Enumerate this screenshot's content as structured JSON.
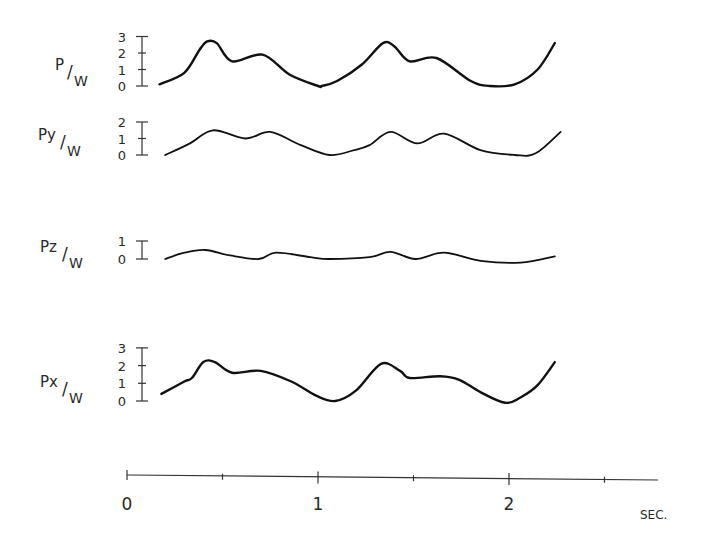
{
  "chart_data": {
    "type": "line",
    "title": "",
    "xlabel": "SEC.",
    "x_ticks": [
      "0",
      "1",
      "2"
    ],
    "x_minor_ticks": [
      0.5,
      1.5,
      2.5
    ],
    "xlim": [
      0,
      2.8
    ],
    "grid": false,
    "legend": null,
    "panels": [
      {
        "name": "P/W",
        "ylabel_num": "P",
        "ylabel_den": "W",
        "y_ticks": [
          "0",
          "1",
          "2",
          "3"
        ],
        "ylim": [
          0,
          3
        ],
        "stroke_width": 2.4,
        "x": [
          0.17,
          0.3,
          0.38,
          0.42,
          0.47,
          0.55,
          0.71,
          0.85,
          1.0,
          1.02,
          1.1,
          1.23,
          1.34,
          1.4,
          1.48,
          1.62,
          1.8,
          1.9,
          2.03,
          2.15,
          2.24
        ],
        "values": [
          0.1,
          0.8,
          2.2,
          2.7,
          2.6,
          1.5,
          1.9,
          0.7,
          0.0,
          0.0,
          0.3,
          1.3,
          2.6,
          2.4,
          1.5,
          1.7,
          0.3,
          0.0,
          0.1,
          1.0,
          2.6
        ]
      },
      {
        "name": "Py/W",
        "ylabel_num": "Py",
        "ylabel_den": "W",
        "y_ticks": [
          "0",
          "1",
          "2"
        ],
        "ylim": [
          0,
          2
        ],
        "stroke_width": 1.8,
        "x": [
          0.2,
          0.33,
          0.45,
          0.62,
          0.75,
          0.91,
          1.06,
          1.19,
          1.27,
          1.38,
          1.52,
          1.66,
          1.85,
          2.03,
          2.14,
          2.27
        ],
        "values": [
          0.0,
          0.7,
          1.5,
          1.0,
          1.4,
          0.6,
          0.0,
          0.3,
          0.6,
          1.4,
          0.7,
          1.3,
          0.3,
          0.0,
          0.1,
          1.4
        ]
      },
      {
        "name": "Pz/W",
        "ylabel_num": "Pz",
        "ylabel_den": "W",
        "y_ticks": [
          "0",
          "1"
        ],
        "ylim": [
          0,
          1
        ],
        "stroke_width": 1.8,
        "x": [
          0.2,
          0.3,
          0.41,
          0.54,
          0.69,
          0.78,
          0.96,
          1.06,
          1.27,
          1.38,
          1.51,
          1.66,
          1.85,
          2.06,
          2.24
        ],
        "values": [
          0.0,
          0.35,
          0.5,
          0.2,
          0.0,
          0.35,
          0.1,
          0.0,
          0.1,
          0.4,
          0.0,
          0.35,
          -0.1,
          -0.2,
          0.15
        ]
      },
      {
        "name": "Px/W",
        "ylabel_num": "Px",
        "ylabel_den": "W",
        "y_ticks": [
          "0",
          "1",
          "2",
          "3"
        ],
        "ylim": [
          0,
          3
        ],
        "stroke_width": 2.4,
        "x": [
          0.18,
          0.3,
          0.34,
          0.4,
          0.46,
          0.55,
          0.7,
          0.86,
          0.99,
          1.09,
          1.2,
          1.33,
          1.43,
          1.48,
          1.64,
          1.74,
          1.85,
          1.98,
          2.06,
          2.15,
          2.24
        ],
        "values": [
          0.4,
          1.1,
          1.3,
          2.2,
          2.2,
          1.6,
          1.7,
          1.1,
          0.3,
          0.0,
          0.6,
          2.1,
          1.7,
          1.3,
          1.4,
          1.2,
          0.5,
          -0.1,
          0.2,
          0.9,
          2.2
        ]
      }
    ]
  }
}
